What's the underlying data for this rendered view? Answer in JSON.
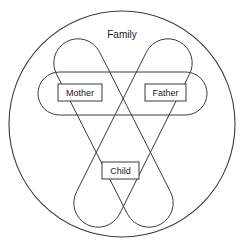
{
  "diagram": {
    "kind": "venn-diagram",
    "title": "Family",
    "canvas": {
      "width": 247,
      "height": 251
    },
    "colors": {
      "background": "#ffffff",
      "stroke": "#3a3a3a",
      "text": "#1a1a1a",
      "fill": "#ffffff"
    },
    "outer_set": {
      "name": "family-circle",
      "label": "Family",
      "shape": "circle",
      "cx": 122,
      "cy": 124,
      "r": 113
    },
    "sets": [
      {
        "name": "parents-horizontal-set",
        "shape": "stadium",
        "orientation": "horizontal",
        "x": 38,
        "y": 72,
        "width": 169,
        "height": 43,
        "rx": 21.5
      },
      {
        "name": "mother-child-diagonal-set",
        "shape": "stadium",
        "orientation": "diagonal-down-right",
        "x1": 78,
        "y1": 63,
        "x2": 148,
        "y2": 203,
        "half_width": 23
      },
      {
        "name": "father-child-diagonal-set",
        "shape": "stadium",
        "orientation": "diagonal-down-left",
        "x1": 168,
        "y1": 63,
        "x2": 99,
        "y2": 203,
        "half_width": 23
      }
    ],
    "nodes": [
      {
        "name": "mother-label",
        "label": "Mother",
        "x": 58,
        "y": 84,
        "width": 44,
        "height": 17
      },
      {
        "name": "father-label",
        "label": "Father",
        "x": 145,
        "y": 84,
        "width": 41,
        "height": 17
      },
      {
        "name": "child-label",
        "label": "Child",
        "x": 102,
        "y": 162,
        "width": 37,
        "height": 17
      }
    ],
    "title_position": {
      "x": 122,
      "y": 35
    }
  }
}
